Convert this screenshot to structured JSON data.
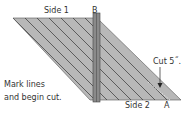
{
  "diagram": {
    "labels": {
      "side1": "Side 1",
      "side2": "Side 2",
      "pointA": "A",
      "pointB": "B",
      "cut": "Cut 5˝.",
      "instruction_line1": "Mark lines",
      "instruction_line2": "and begin cut."
    },
    "colors": {
      "fabric": "#b8b8b8",
      "lines": "#333333",
      "ruler": "#888888",
      "text": "#333333"
    }
  }
}
